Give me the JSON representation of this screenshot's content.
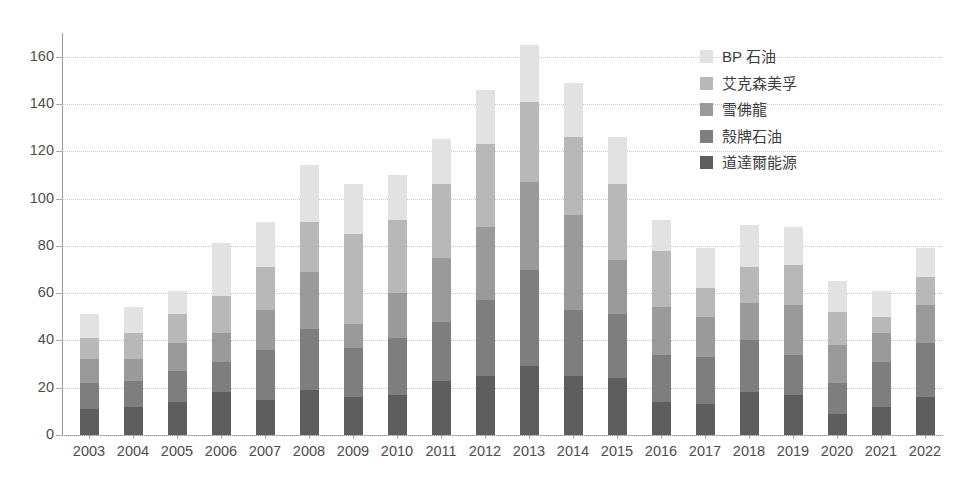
{
  "chart_data": {
    "type": "bar",
    "subtype": "stacked-bar",
    "title": "",
    "subtitle": "",
    "xlabel": "",
    "ylabel": "",
    "ylim": [
      0,
      170
    ],
    "yticks": [
      0,
      20,
      40,
      60,
      80,
      100,
      120,
      140,
      160
    ],
    "ytick_labels": [
      "0",
      "20",
      "40",
      "60",
      "80",
      "100",
      "120",
      "140",
      "160"
    ],
    "grid": true,
    "grid_style": "dotted-horizontal",
    "legend_position": "top-right",
    "categories": [
      "2003",
      "2004",
      "2005",
      "2006",
      "2007",
      "2008",
      "2009",
      "2010",
      "2011",
      "2012",
      "2013",
      "2014",
      "2015",
      "2016",
      "2017",
      "2018",
      "2019",
      "2020",
      "2021",
      "2022"
    ],
    "series": [
      {
        "name": "道達爾能源",
        "color": "#5e5e5e",
        "values": [
          11,
          12,
          14,
          18,
          15,
          19,
          16,
          17,
          23,
          25,
          29,
          25,
          24,
          14,
          13,
          18,
          17,
          9,
          12,
          16
        ]
      },
      {
        "name": "殼牌石油",
        "color": "#7e7e7e",
        "values": [
          11,
          11,
          13,
          13,
          21,
          26,
          21,
          24,
          25,
          32,
          41,
          28,
          27,
          20,
          20,
          22,
          17,
          13,
          19,
          23
        ]
      },
      {
        "name": "雪佛龍",
        "color": "#9a9a9a",
        "values": [
          10,
          9,
          12,
          12,
          17,
          24,
          10,
          19,
          27,
          31,
          37,
          40,
          23,
          20,
          17,
          16,
          21,
          16,
          12,
          16
        ]
      },
      {
        "name": "艾克森美孚",
        "color": "#b8b8b8",
        "values": [
          9,
          11,
          12,
          16,
          18,
          21,
          38,
          31,
          31,
          35,
          34,
          33,
          32,
          24,
          12,
          15,
          17,
          14,
          7,
          12
        ]
      },
      {
        "name": "BP 石油",
        "color": "#e2e2e2",
        "values": [
          10,
          11,
          10,
          22,
          19,
          24,
          21,
          19,
          19,
          23,
          24,
          23,
          20,
          13,
          17,
          18,
          16,
          13,
          11,
          12
        ]
      }
    ],
    "totals": [
      51,
      54,
      61,
      81,
      90,
      114,
      106,
      110,
      125,
      146,
      165,
      149,
      126,
      91,
      79,
      89,
      88,
      65,
      61,
      79
    ]
  },
  "legend": {
    "items": [
      {
        "label": "BP 石油",
        "color": "#e2e2e2"
      },
      {
        "label": "艾克森美孚",
        "color": "#b8b8b8"
      },
      {
        "label": "雪佛龍",
        "color": "#9a9a9a"
      },
      {
        "label": "殼牌石油",
        "color": "#7e7e7e"
      },
      {
        "label": "道達爾能源",
        "color": "#5e5e5e"
      }
    ]
  },
  "axes": {
    "y_tick_labels": [
      "160",
      "140",
      "120",
      "100",
      "80",
      "60",
      "40",
      "20",
      "0"
    ],
    "x_tick_labels": [
      "2003",
      "2004",
      "2005",
      "2006",
      "2007",
      "2008",
      "2009",
      "2010",
      "2011",
      "2012",
      "2013",
      "2014",
      "2015",
      "2016",
      "2017",
      "2018",
      "2019",
      "2020",
      "2021",
      "2022"
    ]
  },
  "colors": {
    "background": "#ffffff",
    "axis": "#9a9a9a",
    "grid": "#c9c9c9",
    "tick_text": "#4d4d4d",
    "legend_text": "#3d3d3d"
  }
}
